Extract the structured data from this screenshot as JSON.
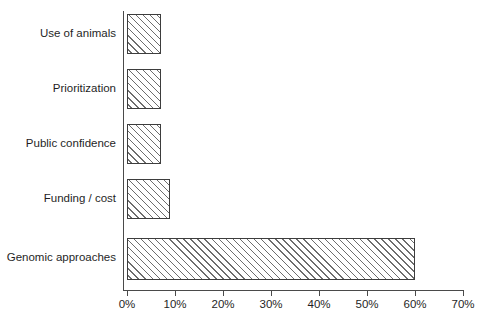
{
  "chart_data": {
    "type": "bar",
    "orientation": "horizontal",
    "title": "",
    "xlabel": "",
    "ylabel": "",
    "categories": [
      "Use of animals",
      "Prioritization",
      "Public confidence",
      "Funding / cost",
      "Genomic approaches"
    ],
    "values": [
      7,
      7,
      7,
      9,
      60
    ],
    "value_unit": "%",
    "xlim": [
      0,
      70
    ],
    "x_tick_labels": [
      "0%",
      "10%",
      "20%",
      "30%",
      "40%",
      "50%",
      "60%",
      "70%"
    ],
    "x_tick_values": [
      0,
      10,
      20,
      30,
      40,
      50,
      60,
      70
    ],
    "grid": false,
    "legend": null,
    "series": [
      {
        "name": "Share of responses",
        "values": [
          7,
          7,
          7,
          9,
          60
        ]
      }
    ],
    "style": {
      "bar_fill": "#ffffff",
      "bar_hatch": "diagonal-forward",
      "bar_hatch_color": "#6d6d6d",
      "bar_border": "#3d3d3d",
      "axis_color": "#4a4a4a",
      "text_color": "#1f1f1f",
      "background": "#ffffff"
    }
  }
}
